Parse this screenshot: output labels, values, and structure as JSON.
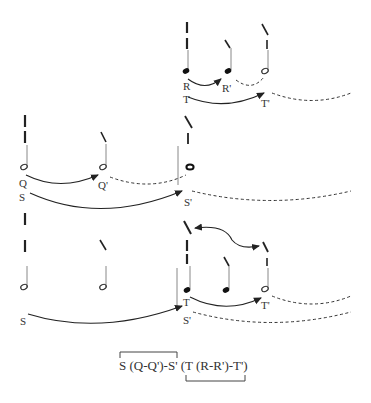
{
  "diagram": {
    "levels": [
      {
        "name": "level-top",
        "notes": [
          {
            "type": "filled",
            "label_top": "R",
            "label_bottom": "T"
          },
          {
            "type": "filled",
            "label_top": "R'"
          },
          {
            "type": "open",
            "label_bottom": "T'"
          }
        ],
        "arrows": [
          {
            "from": "R",
            "to": "R'"
          },
          {
            "from": "T",
            "to": "T'"
          }
        ]
      },
      {
        "name": "level-middle",
        "notes": [
          {
            "type": "open",
            "label_top": "Q",
            "label_bottom": "S"
          },
          {
            "type": "open",
            "label_top": "Q'"
          },
          {
            "type": "whole",
            "label_bottom": "S'"
          }
        ],
        "arrows": [
          {
            "from": "Q",
            "to": "Q'"
          },
          {
            "from": "S",
            "to": "S'"
          }
        ]
      },
      {
        "name": "level-bottom",
        "notes": [
          {
            "type": "open",
            "label": "S"
          },
          {
            "type": "open"
          },
          {
            "type": "filled",
            "label_top": "T",
            "label_bottom": "S'"
          },
          {
            "type": "filled"
          },
          {
            "type": "open",
            "label": "T'"
          }
        ],
        "arrows": [
          {
            "from": "S",
            "to": "S'"
          },
          {
            "from": "T",
            "to": "T'"
          }
        ]
      }
    ],
    "labels": {
      "R": "R",
      "R_prime": "R'",
      "T": "T",
      "T_prime": "T'",
      "Q": "Q",
      "Q_prime": "Q'",
      "S": "S",
      "S_prime": "S'"
    },
    "formula": {
      "left": "S (Q-Q')-S'",
      "right": " (T (R-R')-T')"
    }
  }
}
